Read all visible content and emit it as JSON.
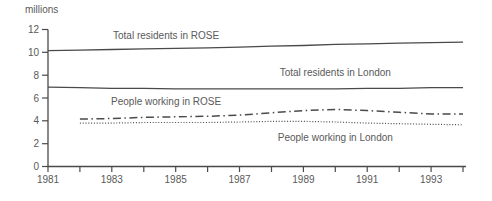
{
  "page": {
    "background": "#ffffff"
  },
  "chart_data": {
    "type": "line",
    "title": "",
    "xlabel": "",
    "ylabel": "millions",
    "xlim": [
      1981,
      1994
    ],
    "ylim": [
      0,
      12
    ],
    "grid": false,
    "legend_position": "inline-annotations",
    "line_color": "#4a4a4a",
    "text_color": "#595959",
    "y_ticks": [
      0,
      2,
      4,
      6,
      8,
      10,
      12
    ],
    "x_ticks": [
      1981,
      1982,
      1983,
      1984,
      1985,
      1986,
      1987,
      1988,
      1989,
      1990,
      1991,
      1992,
      1993,
      1994
    ],
    "x_labeled_ticks": [
      1981,
      1983,
      1985,
      1987,
      1989,
      1991,
      1993
    ],
    "series": [
      {
        "name": "Total residents in ROSE",
        "style": "solid",
        "x": [
          1981,
          1982,
          1983,
          1984,
          1985,
          1986,
          1987,
          1988,
          1989,
          1990,
          1991,
          1992,
          1993,
          1994
        ],
        "values": [
          10.15,
          10.2,
          10.25,
          10.3,
          10.35,
          10.4,
          10.45,
          10.55,
          10.6,
          10.7,
          10.75,
          10.8,
          10.85,
          10.9
        ]
      },
      {
        "name": "Total residents in London",
        "style": "solid",
        "x": [
          1981,
          1982,
          1983,
          1984,
          1985,
          1986,
          1987,
          1988,
          1989,
          1990,
          1991,
          1992,
          1993,
          1994
        ],
        "values": [
          6.95,
          6.9,
          6.85,
          6.85,
          6.8,
          6.8,
          6.8,
          6.8,
          6.8,
          6.8,
          6.85,
          6.85,
          6.9,
          6.9
        ]
      },
      {
        "name": "People working in ROSE",
        "style": "dashdot",
        "x": [
          1982,
          1983,
          1984,
          1985,
          1986,
          1987,
          1988,
          1989,
          1990,
          1991,
          1992,
          1993,
          1994
        ],
        "values": [
          4.15,
          4.2,
          4.3,
          4.35,
          4.4,
          4.5,
          4.7,
          4.9,
          5.0,
          4.9,
          4.75,
          4.6,
          4.6
        ]
      },
      {
        "name": "People working in London",
        "style": "dotted",
        "x": [
          1982,
          1983,
          1984,
          1985,
          1986,
          1987,
          1988,
          1989,
          1990,
          1991,
          1992,
          1993,
          1994
        ],
        "values": [
          3.8,
          3.8,
          3.85,
          3.85,
          3.85,
          3.9,
          3.95,
          3.95,
          3.9,
          3.8,
          3.75,
          3.7,
          3.65
        ]
      }
    ],
    "annotations": [
      {
        "text": "Total residents in ROSE",
        "x": 1984.7,
        "y": 11.2
      },
      {
        "text": "Total residents in London",
        "x": 1990.0,
        "y": 7.9
      },
      {
        "text": "People working in ROSE",
        "x": 1984.7,
        "y": 5.4
      },
      {
        "text": "People working in London",
        "x": 1990.0,
        "y": 2.25
      }
    ]
  }
}
